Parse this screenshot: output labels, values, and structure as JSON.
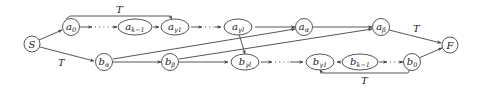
{
  "diagram": {
    "type": "directed-graph",
    "nodes": {
      "S": {
        "base": "S",
        "sub": ""
      },
      "a0": {
        "base": "a",
        "sub": "0"
      },
      "ak1": {
        "base": "a",
        "sub": "k−1"
      },
      "ag1": {
        "base": "a",
        "sub": "γ1"
      },
      "agl": {
        "base": "a",
        "sub": "γl"
      },
      "aal": {
        "base": "a",
        "sub": "α"
      },
      "abe": {
        "base": "a",
        "sub": "β"
      },
      "F": {
        "base": "F",
        "sub": ""
      },
      "bal": {
        "base": "b",
        "sub": "α"
      },
      "bbe": {
        "base": "b",
        "sub": "β"
      },
      "bgl": {
        "base": "b",
        "sub": "γl"
      },
      "bg1": {
        "base": "b",
        "sub": "γ1"
      },
      "bk1": {
        "base": "b",
        "sub": "k−1"
      },
      "b0": {
        "base": "b",
        "sub": "0"
      }
    },
    "edge_labels": {
      "top_T": "T",
      "s_to_balpha_T": "T",
      "abeta_to_F_T": "T",
      "bottom_T": "T"
    },
    "edges": [
      {
        "from": "S",
        "to": "a0"
      },
      {
        "from": "S",
        "to": "bal",
        "label": "T"
      },
      {
        "from": "a0",
        "to": "ak1",
        "style": "dotted"
      },
      {
        "from": "ak1",
        "to": "ag1"
      },
      {
        "from": "a0",
        "to": "ag1",
        "label": "T",
        "style": "arc-over"
      },
      {
        "from": "ag1",
        "to": "agl",
        "style": "dotted"
      },
      {
        "from": "agl",
        "to": "aal"
      },
      {
        "from": "agl",
        "to": "bgl"
      },
      {
        "from": "aal",
        "to": "abe"
      },
      {
        "from": "abe",
        "to": "F",
        "label": "T"
      },
      {
        "from": "bal",
        "to": "bbe"
      },
      {
        "from": "bal",
        "to": "aal"
      },
      {
        "from": "bbe",
        "to": "bgl"
      },
      {
        "from": "bbe",
        "to": "abe"
      },
      {
        "from": "bgl",
        "to": "bg1",
        "style": "dotted"
      },
      {
        "from": "bk1",
        "to": "bg1"
      },
      {
        "from": "bk1",
        "to": "b0",
        "style": "dotted"
      },
      {
        "from": "b0",
        "to": "bg1",
        "label": "T",
        "style": "arc-under"
      },
      {
        "from": "b0",
        "to": "F"
      }
    ]
  }
}
